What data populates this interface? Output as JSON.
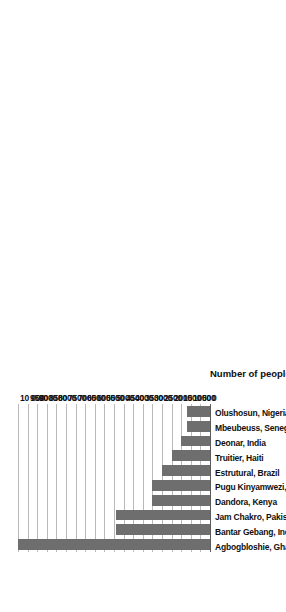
{
  "chart_data": {
    "type": "bar",
    "orientation": "horizontal",
    "title": "",
    "subtitle": "",
    "xlabel": "Number of people living on or around site",
    "ylabel": "",
    "grid": true,
    "legend": false,
    "legend_position": "none",
    "bar_color": "#6e6e6e",
    "axis_color": "#5a5a5a",
    "grid_color": "#b9b9b9",
    "value_axis_range": [
      0,
      10000
    ],
    "value_axis_ticks": [
      0,
      500,
      1000,
      1500,
      2000,
      2500,
      3000,
      3500,
      4000,
      4500,
      5000,
      5500,
      6000,
      6500,
      7000,
      7500,
      8000,
      8500,
      9000,
      9500,
      10000
    ],
    "value_axis_tick_labels": [
      "0",
      "500",
      "1000",
      "1500",
      "2000",
      "2500",
      "3000",
      "3500",
      "4000",
      "4500",
      "5000",
      "5500",
      "6000",
      "6500",
      "7000",
      "7500",
      "8000",
      "8500",
      "9000",
      "9500",
      "10 000"
    ],
    "categories": [
      "Agbogbloshie, Ghana",
      "Bantar Gebang, Indonesia",
      "Jam Chakro, Pakistan",
      "Dandora, Kenya",
      "Pugu Kinyamwezi, Tanzania",
      "Estrutural, Brazil",
      "Truitier, Haiti",
      "Deonar, India",
      "Mbeubeuss, Senegal",
      "Olushosun, Nigeria"
    ],
    "values": [
      10000,
      4900,
      4900,
      3000,
      3000,
      2500,
      2000,
      1500,
      1200,
      1200
    ]
  }
}
